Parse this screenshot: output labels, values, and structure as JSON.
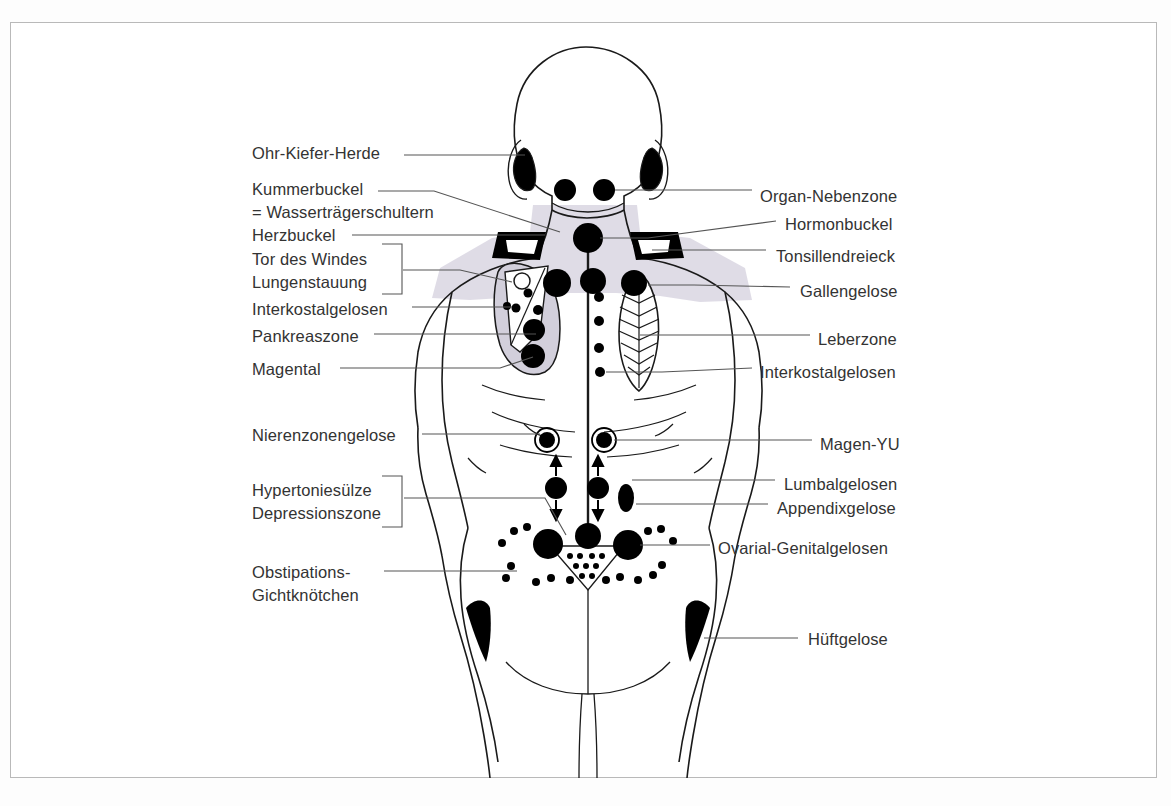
{
  "figure": {
    "view": "posterior-female-torso",
    "frame_color": "#b9b9b9",
    "label_color": "#333333",
    "marker_color": "#000000",
    "zone_shade_color": "#d9d6e2",
    "leader_line_color": "#555555"
  },
  "labels_left": [
    {
      "id": "ohr-kiefer-herde",
      "lines": [
        "Ohr-Kiefer-Herde"
      ],
      "x": 252,
      "y": 142,
      "bracket": false
    },
    {
      "id": "kummerbuckel",
      "lines": [
        "Kummerbuckel",
        "= Wasserträgerschultern"
      ],
      "x": 252,
      "y": 178,
      "bracket": false
    },
    {
      "id": "herzbuckel",
      "lines": [
        "Herzbuckel"
      ],
      "x": 252,
      "y": 222,
      "bracket": false
    },
    {
      "id": "tor-des-windes-lungenstauung",
      "lines": [
        "Tor des Windes",
        "Lungenstauung"
      ],
      "x": 252,
      "y": 248,
      "bracket": true
    },
    {
      "id": "interkostalgelosen-links",
      "lines": [
        "Interkostalgelosen"
      ],
      "x": 252,
      "y": 301,
      "bracket": false
    },
    {
      "id": "pankreaszone",
      "lines": [
        "Pankreaszone"
      ],
      "x": 252,
      "y": 329,
      "bracket": false
    },
    {
      "id": "magental",
      "lines": [
        "Magental"
      ],
      "x": 252,
      "y": 358,
      "bracket": false
    },
    {
      "id": "nierenzonengelose",
      "lines": [
        "Nierenzonengelose"
      ],
      "x": 252,
      "y": 428,
      "bracket": false
    },
    {
      "id": "hypertoniesuelze-depressionszone",
      "lines": [
        "Hypertoniesülze",
        "Depressionszone"
      ],
      "x": 252,
      "y": 489,
      "bracket": true
    },
    {
      "id": "obstipations-gichtknoetchen",
      "lines": [
        "Obstipations-",
        "Gichtknötchen"
      ],
      "x": 252,
      "y": 565,
      "bracket": false
    }
  ],
  "labels_right": [
    {
      "id": "organ-nebenzone",
      "lines": [
        "Organ-Nebenzone"
      ],
      "x": 760,
      "y": 188
    },
    {
      "id": "hormonbuckel",
      "lines": [
        "Hormonbuckel"
      ],
      "x": 785,
      "y": 216
    },
    {
      "id": "tonsillendreieck",
      "lines": [
        "Tonsillendreieck"
      ],
      "x": 776,
      "y": 253
    },
    {
      "id": "gallengelose",
      "lines": [
        "Gallengelose"
      ],
      "x": 800,
      "y": 283
    },
    {
      "id": "leberzone",
      "lines": [
        "Leberzone"
      ],
      "x": 818,
      "y": 330
    },
    {
      "id": "interkostalgelosen-rechts",
      "lines": [
        "Interkostalgelosen"
      ],
      "x": 760,
      "y": 363
    },
    {
      "id": "magen-yu",
      "lines": [
        "Magen-YU"
      ],
      "x": 820,
      "y": 431
    },
    {
      "id": "lumbalgelosen",
      "lines": [
        "Lumbalgelosen"
      ],
      "x": 784,
      "y": 475
    },
    {
      "id": "appendixgelose",
      "lines": [
        "Appendixgelose"
      ],
      "x": 777,
      "y": 500
    },
    {
      "id": "ovarial-genitalgelosen",
      "lines": [
        "Ovarial-Genitalgelosen"
      ],
      "x": 718,
      "y": 536
    },
    {
      "id": "hueftgelose",
      "lines": [
        "Hüftgelose"
      ],
      "x": 808,
      "y": 625
    }
  ],
  "marker_groups": [
    {
      "id": "ohr-kiefer-herde",
      "type": "black-crescent",
      "count": 2
    },
    {
      "id": "organ-nebenzone",
      "type": "dot-pair",
      "count": 2
    },
    {
      "id": "hormonbuckel",
      "type": "large-dot",
      "count": 1
    },
    {
      "id": "tonsillendreieck",
      "type": "black-triangle",
      "count": 2
    },
    {
      "id": "kummerbuckel",
      "type": "shaded-zone",
      "count": 1
    },
    {
      "id": "gallengelose",
      "type": "large-dot",
      "count": 1
    },
    {
      "id": "leberzone",
      "type": "hatched-leaf",
      "count": 1
    },
    {
      "id": "interkostalgelosen",
      "type": "small-dots",
      "count": 5
    },
    {
      "id": "pankreaszone",
      "type": "large-dot",
      "count": 1
    },
    {
      "id": "magental",
      "type": "large-dot",
      "count": 1
    },
    {
      "id": "nierenzonengelose",
      "type": "ringed-dot",
      "count": 2
    },
    {
      "id": "lumbalgelosen",
      "type": "dot-with-arrows",
      "count": 2
    },
    {
      "id": "appendixgelose",
      "type": "oval",
      "count": 1
    },
    {
      "id": "ovarial-genitalgelosen",
      "type": "large-dot",
      "count": 3
    },
    {
      "id": "obstipations-gichtknoetchen",
      "type": "small-dots",
      "count": 22
    },
    {
      "id": "hueftgelose",
      "type": "black-wedge",
      "count": 2
    }
  ]
}
